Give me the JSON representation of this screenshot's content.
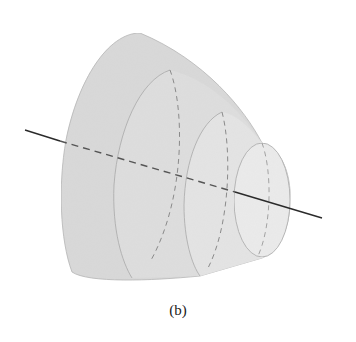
{
  "figure": {
    "caption": "(b)",
    "colors": {
      "background": "#ffffff",
      "shell_outer": "#d9d9d9",
      "shell_second": "#e0e0e0",
      "shell_third": "#e6e6e6",
      "shell_inner": "#ebebeb",
      "edge": "#a8a8a8",
      "axis": "#2a2a2a",
      "hidden_line": "#8a8a8a"
    },
    "axis_line": {
      "label": "axis of revolution",
      "visible_left": "solid",
      "hidden_middle": "dashed",
      "visible_right": "solid"
    },
    "shells": [
      {
        "name": "outer-shell"
      },
      {
        "name": "second-shell"
      },
      {
        "name": "third-shell"
      },
      {
        "name": "inner-end-cap"
      }
    ]
  }
}
